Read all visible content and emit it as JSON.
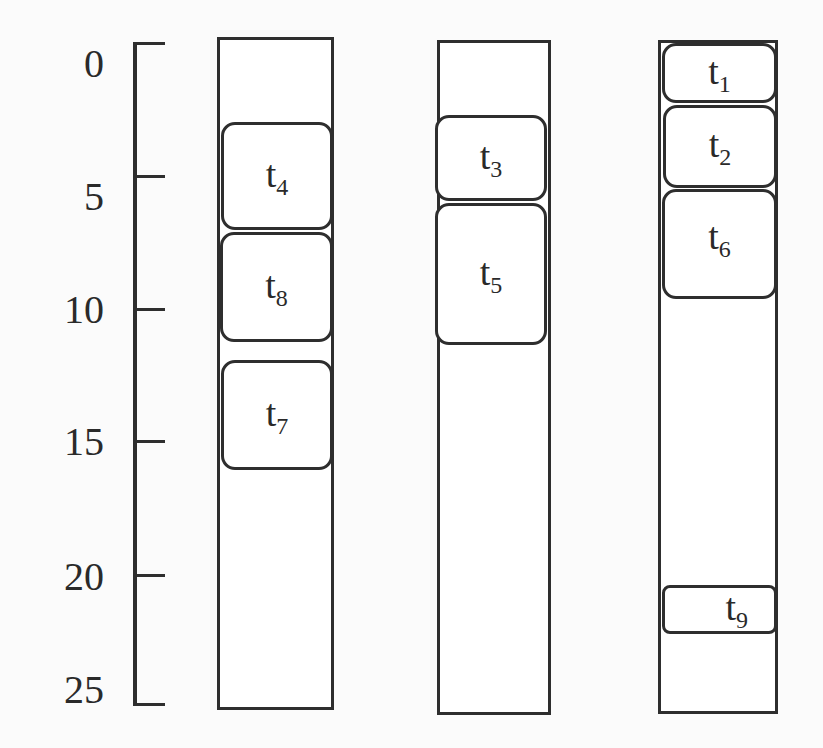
{
  "axis": {
    "ticks": [
      {
        "label": "0",
        "value": 0,
        "y": 43
      },
      {
        "label": "5",
        "value": 5,
        "y": 176
      },
      {
        "label": "10",
        "value": 10,
        "y": 309
      },
      {
        "label": "15",
        "value": 15,
        "y": 441
      },
      {
        "label": "20",
        "value": 20,
        "y": 575
      },
      {
        "label": "25",
        "value": 25,
        "y": 703
      }
    ]
  },
  "columns": [
    {
      "id": "column-1",
      "tasks": [
        {
          "name": "t",
          "sub": "4",
          "start": 3.0,
          "end": 7.0
        },
        {
          "name": "t",
          "sub": "8",
          "start": 7.2,
          "end": 11.2
        },
        {
          "name": "t",
          "sub": "7",
          "start": 12.0,
          "end": 16.0
        }
      ]
    },
    {
      "id": "column-2",
      "tasks": [
        {
          "name": "t",
          "sub": "3",
          "start": 2.7,
          "end": 5.9
        },
        {
          "name": "t",
          "sub": "5",
          "start": 6.0,
          "end": 11.2
        }
      ]
    },
    {
      "id": "column-3",
      "tasks": [
        {
          "name": "t",
          "sub": "1",
          "start": 0.0,
          "end": 2.2
        },
        {
          "name": "t",
          "sub": "2",
          "start": 2.3,
          "end": 5.4
        },
        {
          "name": "t",
          "sub": "6",
          "start": 5.5,
          "end": 9.5
        },
        {
          "name": "t",
          "sub": "9",
          "start": 20.4,
          "end": 22.2
        }
      ]
    }
  ],
  "colors": {
    "stroke": "#2e2e2e",
    "background": "#fbfbfb",
    "fill": "#ffffff"
  }
}
